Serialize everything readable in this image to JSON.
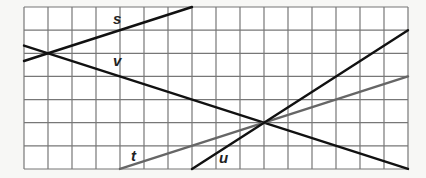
{
  "grid": {
    "columns": 16,
    "rows": 7,
    "origin_x": 24,
    "origin_y": 7,
    "cell_w": 24,
    "cell_h": 23.14,
    "line_color": "#777777",
    "background": "#ffffff"
  },
  "lines": [
    {
      "label": "s",
      "from": [
        0,
        2.333
      ],
      "to": [
        7,
        0
      ],
      "color": "#111111",
      "width": 2.4,
      "label_pos": [
        113,
        24
      ]
    },
    {
      "label": "v",
      "from": [
        0,
        1.667
      ],
      "to": [
        16,
        7
      ],
      "color": "#111111",
      "width": 2.4,
      "label_pos": [
        113,
        66
      ]
    },
    {
      "label": "t",
      "from": [
        4,
        7
      ],
      "to": [
        16,
        3
      ],
      "color": "#666666",
      "width": 2.4,
      "label_pos": [
        131,
        161
      ]
    },
    {
      "label": "u",
      "from": [
        7,
        7
      ],
      "to": [
        16,
        1
      ],
      "color": "#111111",
      "width": 2.4,
      "label_pos": [
        219,
        163
      ]
    }
  ],
  "labels": {
    "s": "s",
    "v": "v",
    "t": "t",
    "u": "u"
  }
}
